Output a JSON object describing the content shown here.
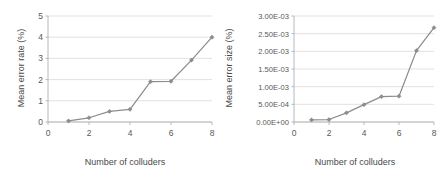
{
  "figure": {
    "background_color": "#ffffff",
    "series_color": "#8d8d8d",
    "gridline_color": "#d9d9d9",
    "axis_color": "#b0b0b0",
    "text_color": "#585858"
  },
  "chart_data": [
    {
      "type": "line",
      "title": "",
      "xlabel": "Number of colluders",
      "ylabel": "Mean error rate (%)",
      "x": [
        1,
        2,
        3,
        4,
        5,
        6,
        7,
        8
      ],
      "values": [
        0.05,
        0.2,
        0.5,
        0.6,
        1.9,
        1.92,
        2.92,
        4.0
      ],
      "xlim": [
        0,
        8
      ],
      "ylim": [
        0,
        5
      ],
      "xticks": [
        0,
        2,
        4,
        6,
        8
      ],
      "xtick_labels": [
        "0",
        "2",
        "4",
        "6",
        "8"
      ],
      "yticks": [
        0,
        1,
        2,
        3,
        4,
        5
      ],
      "ytick_labels": [
        "0",
        "1",
        "2",
        "3",
        "4",
        "5"
      ],
      "grid": true,
      "legend": "none",
      "marker": "diamond"
    },
    {
      "type": "line",
      "title": "",
      "xlabel": "Number of colluders",
      "ylabel": "Mean error size (%)",
      "x": [
        1,
        2,
        3,
        4,
        5,
        6,
        7,
        8
      ],
      "values": [
        6e-05,
        7e-05,
        0.00026,
        0.00049,
        0.00072,
        0.00073,
        0.00202,
        0.00267
      ],
      "xlim": [
        0,
        8
      ],
      "ylim": [
        0,
        0.003
      ],
      "xticks": [
        0,
        2,
        4,
        6,
        8
      ],
      "xtick_labels": [
        "0",
        "2",
        "4",
        "6",
        "8"
      ],
      "yticks": [
        0,
        0.0005,
        0.001,
        0.0015,
        0.002,
        0.0025,
        0.003
      ],
      "ytick_labels": [
        "0.00E+00",
        "5.00E-04",
        "1.00E-03",
        "1.50E-03",
        "2.00E-03",
        "2.50E-03",
        "3.00E-03"
      ],
      "grid": true,
      "legend": "none",
      "marker": "diamond"
    }
  ]
}
